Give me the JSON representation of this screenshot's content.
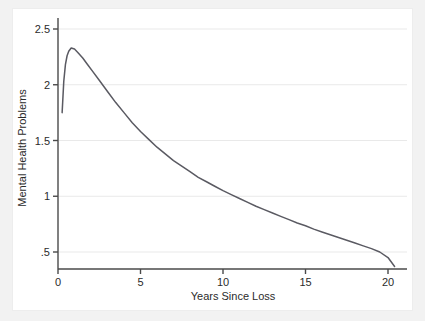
{
  "chart_data": {
    "type": "line",
    "title": "",
    "subtitle": "",
    "xlabel": "Years Since Loss",
    "ylabel": "Mental Health Problems",
    "xlim": [
      -0.4,
      21.2
    ],
    "ylim": [
      0.3,
      2.62
    ],
    "xticks": [
      0,
      5,
      10,
      15,
      20
    ],
    "xticklabels": [
      "0",
      "5",
      "10",
      "15",
      "20"
    ],
    "yticks": [
      0.5,
      1,
      1.5,
      2,
      2.5
    ],
    "yticklabels": [
      ".5",
      "1",
      "1.5",
      "2",
      "2.5"
    ],
    "grid": "horizontal",
    "legend": "none",
    "line_color": "#5a5a62",
    "grid_color": "#e9e9e9",
    "axis_color": "#4a4a4a",
    "background_color": "#ffffff",
    "surround_color": "#f2f2f2",
    "series": [
      {
        "name": "Mental Health Problems",
        "x": [
          0.25,
          0.35,
          0.45,
          0.55,
          0.65,
          0.8,
          1.0,
          1.2,
          1.5,
          1.8,
          2.1,
          2.5,
          3.0,
          3.5,
          4.0,
          4.5,
          5.0,
          5.5,
          6.0,
          6.5,
          7.0,
          7.5,
          8.0,
          8.5,
          9.0,
          9.5,
          10.0,
          10.5,
          11.0,
          11.5,
          12.0,
          12.5,
          13.0,
          13.5,
          14.0,
          14.5,
          15.0,
          15.5,
          16.0,
          16.5,
          17.0,
          17.5,
          18.0,
          18.5,
          19.0,
          19.5,
          20.0,
          20.4
        ],
        "y": [
          1.75,
          2.03,
          2.18,
          2.26,
          2.3,
          2.33,
          2.32,
          2.29,
          2.24,
          2.18,
          2.12,
          2.04,
          1.94,
          1.84,
          1.75,
          1.66,
          1.58,
          1.51,
          1.44,
          1.38,
          1.32,
          1.27,
          1.22,
          1.17,
          1.13,
          1.09,
          1.05,
          1.015,
          0.98,
          0.945,
          0.91,
          0.88,
          0.85,
          0.82,
          0.79,
          0.76,
          0.735,
          0.705,
          0.68,
          0.655,
          0.63,
          0.605,
          0.58,
          0.555,
          0.53,
          0.5,
          0.45,
          0.37
        ]
      }
    ],
    "annotations": []
  }
}
